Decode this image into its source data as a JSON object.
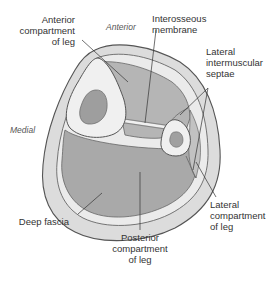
{
  "diagram": {
    "orientation": {
      "anterior": "Anterior",
      "medial": "Medial"
    },
    "labels": {
      "anterior_compartment": [
        "Anterior",
        "compartment",
        "of leg"
      ],
      "interosseous_membrane": [
        "Interosseous",
        "membrane"
      ],
      "lateral_intermuscular_septae": [
        "Lateral",
        "intermuscular",
        "septae"
      ],
      "lateral_compartment": [
        "Lateral",
        "compartment",
        "of leg"
      ],
      "deep_fascia": [
        "Deep fascia"
      ],
      "posterior_compartment": [
        "Posterior",
        "compartment",
        "of leg"
      ]
    },
    "colors": {
      "outer_skin": "#d9d9d9",
      "subcutaneous": "#e6e6e6",
      "compartment_fill": "#a8a8a8",
      "bone": "#eeeeee",
      "marrow": "#9a9a9a",
      "outline": "#555555",
      "leader_line": "#333333"
    }
  }
}
